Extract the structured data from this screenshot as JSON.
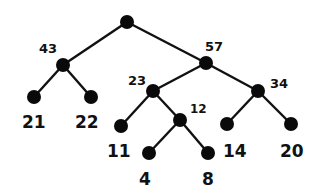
{
  "tree": {
    "nodes": [
      {
        "id": "root",
        "x": 127,
        "y": 22,
        "label": ""
      },
      {
        "id": "n43",
        "x": 63,
        "y": 65,
        "label": "43",
        "lx": 39,
        "ly": 53,
        "size": 13
      },
      {
        "id": "n57",
        "x": 206,
        "y": 63,
        "label": "57",
        "lx": 205,
        "ly": 51,
        "size": 13
      },
      {
        "id": "n21",
        "x": 34,
        "y": 97,
        "label": "21",
        "lx": 22,
        "ly": 128,
        "size": 17
      },
      {
        "id": "n22",
        "x": 91,
        "y": 97,
        "label": "22",
        "lx": 75,
        "ly": 128,
        "size": 17
      },
      {
        "id": "n23",
        "x": 153,
        "y": 91,
        "label": "23",
        "lx": 128,
        "ly": 85,
        "size": 13
      },
      {
        "id": "n34",
        "x": 258,
        "y": 91,
        "label": "34",
        "lx": 270,
        "ly": 88,
        "size": 13
      },
      {
        "id": "n11",
        "x": 121,
        "y": 126,
        "label": "11",
        "lx": 107,
        "ly": 157,
        "size": 17
      },
      {
        "id": "n12",
        "x": 180,
        "y": 120,
        "label": "12",
        "lx": 190,
        "ly": 113,
        "size": 12
      },
      {
        "id": "n14",
        "x": 227,
        "y": 124,
        "label": "14",
        "lx": 223,
        "ly": 157,
        "size": 17
      },
      {
        "id": "n20",
        "x": 291,
        "y": 124,
        "label": "20",
        "lx": 280,
        "ly": 157,
        "size": 17
      },
      {
        "id": "n4",
        "x": 149,
        "y": 153,
        "label": "4",
        "lx": 139,
        "ly": 185,
        "size": 17
      },
      {
        "id": "n8",
        "x": 208,
        "y": 153,
        "label": "8",
        "lx": 202,
        "ly": 185,
        "size": 17
      }
    ],
    "edges": [
      [
        "root",
        "n43"
      ],
      [
        "root",
        "n57"
      ],
      [
        "n43",
        "n21"
      ],
      [
        "n43",
        "n22"
      ],
      [
        "n57",
        "n23"
      ],
      [
        "n57",
        "n34"
      ],
      [
        "n23",
        "n11"
      ],
      [
        "n23",
        "n12"
      ],
      [
        "n12",
        "n4"
      ],
      [
        "n12",
        "n8"
      ],
      [
        "n34",
        "n14"
      ],
      [
        "n34",
        "n20"
      ]
    ]
  }
}
